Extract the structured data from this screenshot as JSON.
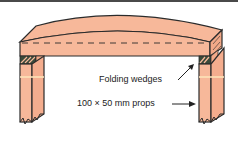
{
  "diagram": {
    "colors": {
      "timber": "#f7b89a",
      "timber_highlight": "#fde2b8",
      "outline": "#2b2b2b",
      "wedge_dark": "#3a4a3a",
      "frame": "#4a4a4a",
      "background": "#ffffff"
    },
    "labels": {
      "wedges": "Folding wedges",
      "props": "100 × 50 mm props"
    }
  }
}
